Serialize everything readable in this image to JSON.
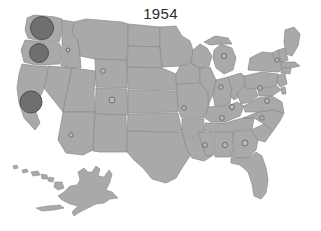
{
  "figure": {
    "title": "1954",
    "background_color": "#ffffff",
    "title_color": "#2b2b2b"
  },
  "chart_data": {
    "type": "map",
    "map_subtype": "proportional-symbol-bubble-map",
    "title": "1954",
    "subtitle": "",
    "xlabel": "",
    "ylabel": "",
    "region": "United States",
    "projection_note": "Contiguous US with Alaska and Hawaii insets at lower left",
    "legend": null,
    "grid": false,
    "colors": {
      "land_fill": "#a9a9a9",
      "land_stroke": "#8a8a8a",
      "water_fill": "#ffffff",
      "bubble_large_fill": "#6f6f6f",
      "bubble_large_stroke": "#4a4a4a",
      "bubble_small_fill": "#b9b9b9",
      "bubble_small_stroke": "#5d5d5d",
      "background": "#ffffff"
    },
    "value_encoding": "circle area proportional to value",
    "series": [
      {
        "name": "1954 values by state",
        "points": [
          {
            "state": "Washington",
            "code": "WA",
            "x": 42,
            "y": 28,
            "radius": 11.5,
            "size_class": "large",
            "value": 132
          },
          {
            "state": "Oregon",
            "code": "OR",
            "x": 39,
            "y": 53,
            "radius": 9.5,
            "size_class": "large",
            "value": 90
          },
          {
            "state": "California",
            "code": "CA",
            "x": 31,
            "y": 102,
            "radius": 11.0,
            "size_class": "large",
            "value": 121
          },
          {
            "state": "Idaho",
            "code": "ID",
            "x": 68,
            "y": 50,
            "radius": 2.0,
            "size_class": "small",
            "value": 4
          },
          {
            "state": "Montana",
            "code": "MT",
            "x": 103,
            "y": 71,
            "radius": 2.4,
            "size_class": "small",
            "value": 6
          },
          {
            "state": "Wyoming",
            "code": "WY",
            "x": 112,
            "y": 100,
            "radius": 3.0,
            "size_class": "small",
            "value": 9
          },
          {
            "state": "Arizona",
            "code": "AZ",
            "x": 71,
            "y": 135,
            "radius": 2.2,
            "size_class": "small",
            "value": 5
          },
          {
            "state": "Nebraska",
            "code": "NE",
            "x": 184,
            "y": 108,
            "radius": 2.2,
            "size_class": "small",
            "value": 5
          },
          {
            "state": "Michigan",
            "code": "MI",
            "x": 224,
            "y": 56,
            "radius": 2.6,
            "size_class": "small",
            "value": 7
          },
          {
            "state": "New Hampshire",
            "code": "NH",
            "x": 277,
            "y": 60,
            "radius": 2.2,
            "size_class": "small",
            "value": 5
          },
          {
            "state": "Pennsylvania",
            "code": "PA",
            "x": 260,
            "y": 88,
            "radius": 2.4,
            "size_class": "small",
            "value": 6
          },
          {
            "state": "Ohio",
            "code": "OH",
            "x": 221,
            "y": 87,
            "radius": 2.2,
            "size_class": "small",
            "value": 5
          },
          {
            "state": "Indiana",
            "code": "IN",
            "x": 232,
            "y": 107,
            "radius": 2.6,
            "size_class": "small",
            "value": 7
          },
          {
            "state": "Virginia",
            "code": "VA",
            "x": 267,
            "y": 101,
            "radius": 2.4,
            "size_class": "small",
            "value": 6
          },
          {
            "state": "Kentucky",
            "code": "KY",
            "x": 222,
            "y": 118,
            "radius": 2.4,
            "size_class": "small",
            "value": 6
          },
          {
            "state": "North Carolina",
            "code": "NC",
            "x": 262,
            "y": 118,
            "radius": 2.2,
            "size_class": "small",
            "value": 5
          },
          {
            "state": "Mississippi",
            "code": "MS",
            "x": 205,
            "y": 145,
            "radius": 2.4,
            "size_class": "small",
            "value": 6
          },
          {
            "state": "Alabama",
            "code": "AL",
            "x": 225,
            "y": 145,
            "radius": 2.6,
            "size_class": "small",
            "value": 7
          },
          {
            "state": "Georgia",
            "code": "GA",
            "x": 245,
            "y": 143,
            "radius": 3.0,
            "size_class": "small",
            "value": 9
          }
        ]
      }
    ],
    "annotations": []
  }
}
